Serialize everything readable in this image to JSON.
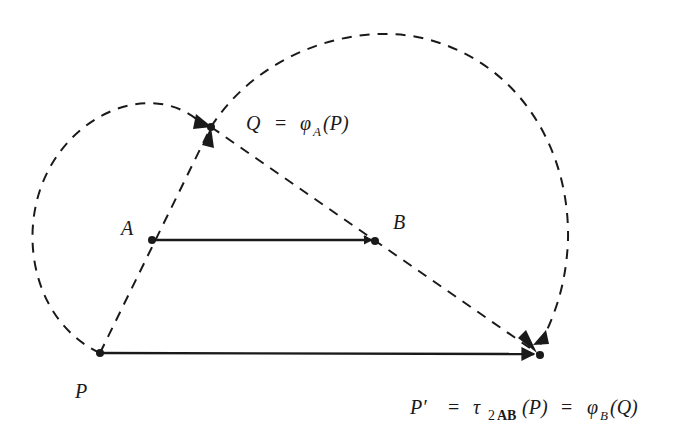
{
  "colors": {
    "ink": "#1a1a1a",
    "background": "#ffffff"
  },
  "points": {
    "P": {
      "label": "P",
      "x": 100,
      "y": 353
    },
    "A": {
      "label": "A",
      "x": 152,
      "y": 240
    },
    "B": {
      "label": "B",
      "x": 375,
      "y": 241
    },
    "Q": {
      "label": "Q",
      "x": 211,
      "y": 127
    },
    "Pprime": {
      "label": "P′",
      "x": 540,
      "y": 355
    }
  },
  "labels": {
    "P": "P",
    "A": "A",
    "B": "B",
    "Q_eq": {
      "Q": "Q",
      "eq": "=",
      "phi": "φ",
      "sub": "A",
      "arg": "(P)"
    },
    "Pprime_eq": {
      "Pp": "P′",
      "eq1": "=",
      "tau": "τ",
      "sub_num": "2",
      "sub_bold": "AB",
      "arg1": "(P)",
      "eq2": "=",
      "phi": "φ",
      "sub2": "B",
      "arg2": "(Q)"
    }
  },
  "elements": {
    "solid_arrows": [
      "A→B",
      "P→P′"
    ],
    "dashed_paths": [
      "P–A–Q line",
      "Q–B–P′ line",
      "arc P→Q about A",
      "arc Q→P′ about B"
    ]
  }
}
